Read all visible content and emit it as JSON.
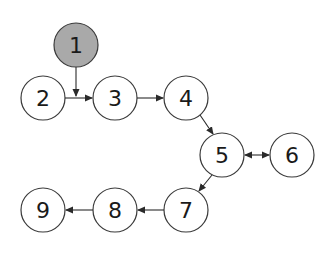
{
  "diagram": {
    "type": "directed-graph",
    "colors": {
      "default_fill": "#ffffff",
      "highlight_fill": "#a9a9a9",
      "stroke": "#3a3a3a",
      "text": "#1a1a1a"
    },
    "radius": 22,
    "nodes": [
      {
        "id": "1",
        "label": "1",
        "x": 76,
        "y": 45,
        "highlighted": true
      },
      {
        "id": "2",
        "label": "2",
        "x": 43,
        "y": 98,
        "highlighted": false
      },
      {
        "id": "3",
        "label": "3",
        "x": 115,
        "y": 98,
        "highlighted": false
      },
      {
        "id": "4",
        "label": "4",
        "x": 186,
        "y": 98,
        "highlighted": false
      },
      {
        "id": "5",
        "label": "5",
        "x": 222,
        "y": 155,
        "highlighted": false
      },
      {
        "id": "6",
        "label": "6",
        "x": 292,
        "y": 155,
        "highlighted": false
      },
      {
        "id": "7",
        "label": "7",
        "x": 186,
        "y": 210,
        "highlighted": false
      },
      {
        "id": "8",
        "label": "8",
        "x": 115,
        "y": 210,
        "highlighted": false
      },
      {
        "id": "9",
        "label": "9",
        "x": 43,
        "y": 210,
        "highlighted": false
      }
    ],
    "edges": [
      {
        "from": "1",
        "to": "2-3-edge",
        "note": "vertical arrow from node 1 down onto edge 2->3"
      },
      {
        "from": "2",
        "to": "3",
        "direction": "forward"
      },
      {
        "from": "3",
        "to": "4",
        "direction": "forward"
      },
      {
        "from": "4",
        "to": "5",
        "direction": "forward"
      },
      {
        "from": "5",
        "to": "6",
        "direction": "bidirectional"
      },
      {
        "from": "5",
        "to": "7",
        "direction": "forward"
      },
      {
        "from": "7",
        "to": "8",
        "direction": "forward"
      },
      {
        "from": "8",
        "to": "9",
        "direction": "forward"
      }
    ]
  }
}
